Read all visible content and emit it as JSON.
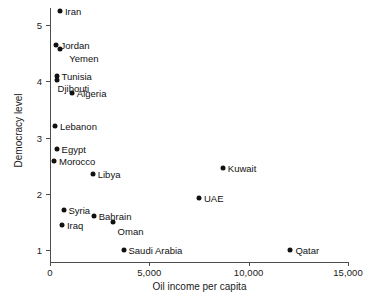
{
  "chart_data": {
    "type": "scatter",
    "title": "",
    "xlabel": "Oil income per capita",
    "ylabel": "Democracy level",
    "xlim": [
      0,
      15000
    ],
    "ylim": [
      0.75,
      5.45
    ],
    "grid": false,
    "legend": "none",
    "xticks": [
      {
        "value": 0,
        "label": "0"
      },
      {
        "value": 5000,
        "label": "5,000"
      },
      {
        "value": 10000,
        "label": "10,000"
      },
      {
        "value": 15000,
        "label": "15,000"
      }
    ],
    "yticks": [
      {
        "value": 1,
        "label": "1"
      },
      {
        "value": 2,
        "label": "2"
      },
      {
        "value": 3,
        "label": "3"
      },
      {
        "value": 4,
        "label": "4"
      },
      {
        "value": 5,
        "label": "5"
      }
    ],
    "points": [
      {
        "name": "Iran",
        "x": 500,
        "y": 5.25,
        "label_side": "right"
      },
      {
        "name": "Jordan",
        "x": 280,
        "y": 4.65,
        "label_side": "right"
      },
      {
        "name": "Yemen",
        "x": 520,
        "y": 4.58,
        "label_side": "right"
      },
      {
        "name": "Tunisia",
        "x": 330,
        "y": 4.1,
        "label_side": "right"
      },
      {
        "name": "Djibouti",
        "x": 330,
        "y": 4.03,
        "label_side": "right"
      },
      {
        "name": "Algeria",
        "x": 1100,
        "y": 3.8,
        "label_side": "right"
      },
      {
        "name": "Lebanon",
        "x": 250,
        "y": 3.2,
        "label_side": "right"
      },
      {
        "name": "Egypt",
        "x": 330,
        "y": 2.8,
        "label_side": "right"
      },
      {
        "name": "Morocco",
        "x": 200,
        "y": 2.58,
        "label_side": "right"
      },
      {
        "name": "Libya",
        "x": 2150,
        "y": 2.35,
        "label_side": "right"
      },
      {
        "name": "Kuwait",
        "x": 8700,
        "y": 2.46,
        "label_side": "right"
      },
      {
        "name": "UAE",
        "x": 7500,
        "y": 1.92,
        "label_side": "right"
      },
      {
        "name": "Syria",
        "x": 680,
        "y": 1.72,
        "label_side": "right"
      },
      {
        "name": "Bahrain",
        "x": 2200,
        "y": 1.6,
        "label_side": "right"
      },
      {
        "name": "Iraq",
        "x": 600,
        "y": 1.45,
        "label_side": "right"
      },
      {
        "name": "Oman",
        "x": 3150,
        "y": 1.5,
        "label_side": "right"
      },
      {
        "name": "Saudi Arabia",
        "x": 3700,
        "y": 1.0,
        "label_side": "right"
      },
      {
        "name": "Qatar",
        "x": 12100,
        "y": 1.0,
        "label_side": "right"
      }
    ],
    "point_color": "#111111",
    "axis_color": "#4d4d4d",
    "text_color": "#1a1a1a",
    "background": "#ffffff"
  },
  "label_offsets": {
    "Djibouti": {
      "dx": -4,
      "dy": 8
    },
    "Yemen": {
      "dx": 4,
      "dy": 9
    },
    "Oman": {
      "dx": 0,
      "dy": 9
    }
  }
}
